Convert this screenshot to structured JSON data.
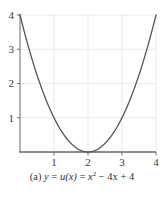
{
  "figure": {
    "caption_label": "(a)",
    "caption_full": "(a) y = u(x) = x² − 4x + 4",
    "caption_parts": {
      "index": "(a)",
      "lhs_var": "y",
      "eq1": "=",
      "func_name": "u",
      "func_arg": "(x)",
      "eq2": "=",
      "term_base": "x",
      "term_exp": "2",
      "term_linear": "− 4x",
      "term_const": "+ 4"
    }
  },
  "colors": {
    "curve": "#555555",
    "axis": "#808080",
    "grid": "#e9e9e9",
    "tick_label": "#3a3a3a",
    "background": "#ffffff",
    "caption_text": "#333333"
  },
  "chart_data": {
    "type": "line",
    "title": "",
    "subtitle": "",
    "xlabel": "",
    "ylabel": "",
    "xlim": [
      0,
      4
    ],
    "ylim": [
      0,
      4
    ],
    "xticks": [
      1,
      2,
      3,
      4
    ],
    "yticks": [
      1,
      2,
      3,
      4
    ],
    "xtick_labels": [
      "1",
      "2",
      "3",
      "4"
    ],
    "ytick_labels": [
      "1",
      "2",
      "3",
      "4"
    ],
    "grid": true,
    "grid_axis": "both",
    "legend": false,
    "legend_position": "none",
    "annotations": [],
    "equation": "y = u(x) = x^2 - 4x + 4",
    "vertex": [
      2,
      0
    ],
    "series": [
      {
        "name": "u(x) = x^2 - 4x + 4",
        "x": [
          0,
          0.2,
          0.4,
          0.6,
          0.8,
          1,
          1.2,
          1.4,
          1.6,
          1.8,
          2,
          2.2,
          2.4,
          2.6,
          2.8,
          3,
          3.2,
          3.4,
          3.6,
          3.8,
          4
        ],
        "values": [
          4,
          3.24,
          2.56,
          1.96,
          1.44,
          1,
          0.64,
          0.36,
          0.16,
          0.04,
          0,
          0.04,
          0.16,
          0.36,
          0.64,
          1,
          1.44,
          1.96,
          2.56,
          3.24,
          4
        ]
      }
    ]
  }
}
